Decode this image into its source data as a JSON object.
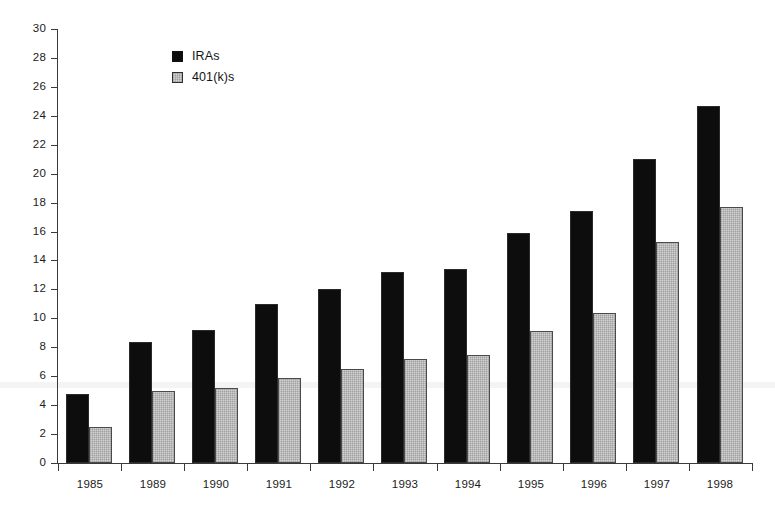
{
  "chart_data": {
    "type": "bar",
    "title": "",
    "subtitle": "",
    "xlabel": "",
    "ylabel": "",
    "categories": [
      "1985",
      "1989",
      "1990",
      "1991",
      "1992",
      "1993",
      "1994",
      "1995",
      "1996",
      "1997",
      "1998"
    ],
    "series": [
      {
        "name": "IRAs",
        "color": "#0d0d0d",
        "values": [
          4.8,
          8.4,
          9.2,
          11.0,
          12.0,
          13.2,
          13.4,
          15.9,
          17.4,
          21.0,
          24.7
        ]
      },
      {
        "name": "401(k)s",
        "color": "#d2d2d2",
        "values": [
          2.5,
          5.0,
          5.2,
          5.9,
          6.5,
          7.2,
          7.5,
          9.1,
          10.4,
          15.3,
          17.7
        ]
      }
    ],
    "ylim": [
      0,
      30
    ],
    "ytick_step": 2,
    "ytick_labels": [
      "0",
      "2",
      "4",
      "6",
      "8",
      "10",
      "12",
      "14",
      "16",
      "18",
      "20",
      "22",
      "24",
      "26",
      "28",
      "30"
    ],
    "grid": false,
    "legend_position": "top-left-inside",
    "legend": [
      "IRAs",
      "401(k)s"
    ]
  },
  "legend": {
    "entries": [
      {
        "label": "IRAs",
        "swatch": "black-filled-square-icon"
      },
      {
        "label": "401(k)s",
        "swatch": "gray-hatched-square-icon"
      }
    ]
  }
}
